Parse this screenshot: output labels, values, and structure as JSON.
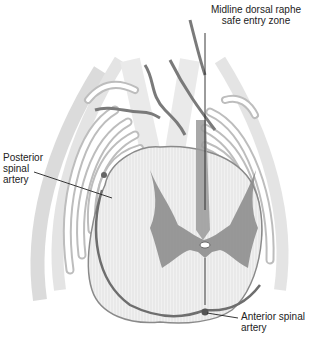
{
  "figure": {
    "colors": {
      "background": "#ffffff",
      "white_matter": "#e8e8e8",
      "gray_matter": "#8a8a8a",
      "vessel": "#6e6e6e",
      "leader_line": "#222222"
    }
  },
  "labels": {
    "midline": {
      "line1": "Midline dorsal raphe",
      "line2": "safe entry zone"
    },
    "posterior": {
      "line1": "Posterior",
      "line2": "spinal",
      "line3": "artery"
    },
    "anterior": {
      "line1": "Anterior spinal",
      "line2": "artery"
    }
  }
}
